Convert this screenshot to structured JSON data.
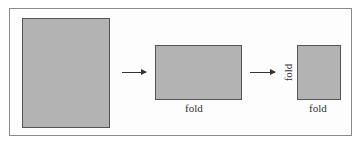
{
  "diagram": {
    "steps": [
      {
        "name": "full-sheet"
      },
      {
        "name": "folded-once",
        "fold_label": "fold"
      },
      {
        "name": "folded-twice",
        "fold_label_side": "fold",
        "fold_label_bottom": "fold"
      }
    ],
    "colors": {
      "sheet": "#b3b3b3",
      "outline": "#555555",
      "frame": "#8a8a8a"
    }
  }
}
